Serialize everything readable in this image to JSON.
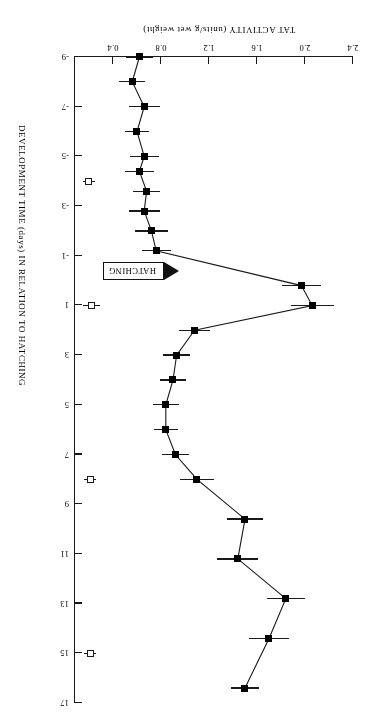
{
  "chart_data": {
    "type": "line",
    "title": "",
    "xlabel": "DEVELOPMENT TIME (days) IN RELATION TO HATCHING",
    "ylabel": "TAT ACTIVITY (units/g wet weight)",
    "orientation": "rotated-180",
    "grid": false,
    "legend": "none",
    "xlim": [
      -9,
      17
    ],
    "ylim": [
      0.4,
      2.4
    ],
    "xticks": [
      -9,
      -7,
      -5,
      -3,
      -1,
      1,
      3,
      5,
      7,
      9,
      11,
      13,
      15,
      17
    ],
    "xtick_labels": [
      "-9",
      "-7",
      "-5",
      "-3",
      "-1",
      "1",
      "3",
      "5",
      "7",
      "9",
      "11",
      "13",
      "15",
      "17"
    ],
    "yticks": [
      0.4,
      0.8,
      1.2,
      1.6,
      2.0,
      2.4
    ],
    "ytick_labels": [
      "0.4",
      "0.8",
      "1.2",
      "1.6",
      "2.0",
      "2.4"
    ],
    "annotations": [
      {
        "name": "hatching-marker",
        "text": "HATCHING",
        "x_day": -0.4,
        "arrow": "left"
      }
    ],
    "series": [
      {
        "name": "TAT activity (filled squares)",
        "marker": "filled-square",
        "x": [
          -9,
          -8,
          -7,
          -6,
          -5,
          -4.4,
          -3.6,
          -2.8,
          -2,
          -1.2,
          0.2,
          1.0,
          2.0,
          3.0,
          4.0,
          5.0,
          6.0,
          7.0,
          8.0,
          9.6,
          11.2,
          12.8,
          14.4,
          16.4
        ],
        "y": [
          0.62,
          0.56,
          0.66,
          0.6,
          0.66,
          0.62,
          0.68,
          0.66,
          0.72,
          0.76,
          1.97,
          2.06,
          1.08,
          0.93,
          0.9,
          0.84,
          0.84,
          0.92,
          1.1,
          1.5,
          1.44,
          1.84,
          1.7,
          1.5
        ],
        "yerr": [
          0.11,
          0.11,
          0.13,
          0.1,
          0.12,
          0.12,
          0.11,
          0.13,
          0.14,
          0.12,
          0.16,
          0.18,
          0.13,
          0.11,
          0.11,
          0.11,
          0.1,
          0.11,
          0.14,
          0.15,
          0.17,
          0.16,
          0.17,
          0.12
        ]
      },
      {
        "name": "control (open squares)",
        "marker": "open-square",
        "x": [
          -4,
          1,
          8,
          15
        ],
        "y": [
          0.2,
          0.22,
          0.21,
          0.21
        ],
        "yerr": [
          0.05,
          0.07,
          0.05,
          0.05
        ]
      }
    ]
  }
}
